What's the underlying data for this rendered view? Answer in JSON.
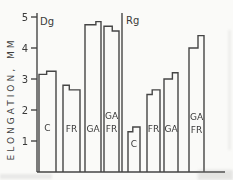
{
  "chart_data": {
    "type": "bar",
    "title": "",
    "ylabel": "ELONGATION, MM",
    "xlabel": "",
    "ylim": [
      0,
      5
    ],
    "yticks": [
      1,
      2,
      3,
      4,
      5
    ],
    "grid": false,
    "legend": "none",
    "panels": [
      {
        "label": "Dg",
        "bars": [
          {
            "label": "C",
            "label_lines": [
              "C"
            ],
            "values": [
              3.15,
              3.25
            ]
          },
          {
            "label": "FR",
            "label_lines": [
              "FR"
            ],
            "values": [
              2.8,
              2.65
            ]
          },
          {
            "label": "GA",
            "label_lines": [
              "GA"
            ],
            "values": [
              4.75,
              4.85
            ]
          },
          {
            "label": "GA FR",
            "label_lines": [
              "GA",
              "FR"
            ],
            "values": [
              4.7,
              4.55
            ]
          }
        ]
      },
      {
        "label": "Rg",
        "bars": [
          {
            "label": "C",
            "label_lines": [
              "C"
            ],
            "values": [
              1.3,
              1.45
            ]
          },
          {
            "label": "FR",
            "label_lines": [
              "FR"
            ],
            "values": [
              2.5,
              2.65
            ]
          },
          {
            "label": "GA",
            "label_lines": [
              "GA"
            ],
            "values": [
              3.0,
              3.2
            ]
          },
          {
            "label": "GA FR",
            "label_lines": [
              "GA",
              "FR"
            ],
            "values": [
              4.0,
              4.4
            ]
          }
        ]
      }
    ],
    "layout": {
      "width": 233,
      "height": 180,
      "axis_x": 37,
      "baseline_y": 172,
      "axis_right_x": 225,
      "axis_top_y": 13,
      "divider_x": 122,
      "px_per_unit": 31,
      "tick_len": 6,
      "bar_geom": [
        {
          "x": 39,
          "w": 17,
          "split": 0.45,
          "label_baselines": [
            131
          ]
        },
        {
          "x": 63,
          "w": 17,
          "split": 0.37,
          "label_baselines": [
            132
          ]
        },
        {
          "x": 85,
          "w": 16,
          "split": 0.68,
          "label_baselines": [
            132
          ]
        },
        {
          "x": 104,
          "w": 15,
          "split": 0.55,
          "label_baselines": [
            119,
            132
          ]
        },
        {
          "x": 128,
          "w": 12,
          "split": 0.4,
          "label_baselines": [
            147
          ]
        },
        {
          "x": 147,
          "w": 13,
          "split": 0.4,
          "label_baselines": [
            132
          ]
        },
        {
          "x": 164,
          "w": 14,
          "split": 0.6,
          "label_baselines": [
            132
          ]
        },
        {
          "x": 189,
          "w": 15,
          "split": 0.6,
          "label_baselines": [
            120,
            133
          ]
        }
      ]
    },
    "colors": {
      "line": "#454545",
      "text": "#3a3a3a",
      "background": "#fafaf8"
    }
  }
}
